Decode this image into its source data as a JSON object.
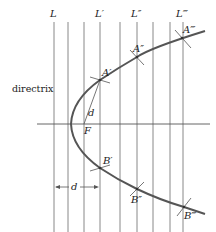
{
  "figure": {
    "colors": {
      "lines": "#7a7a7a",
      "curve": "#555555",
      "text": "#222222"
    },
    "vertical_lines": [
      {
        "x": 54,
        "label": "L"
      },
      {
        "x": 68,
        "label": ""
      },
      {
        "x": 84,
        "label": ""
      },
      {
        "x": 100,
        "label": "L′"
      },
      {
        "x": 120,
        "label": ""
      },
      {
        "x": 137,
        "label": "L″"
      },
      {
        "x": 153,
        "label": ""
      },
      {
        "x": 170,
        "label": ""
      },
      {
        "x": 183,
        "label": "L‴"
      }
    ],
    "labels": {
      "L": "L",
      "L1": "L′",
      "L2": "L″",
      "L3": "L‴",
      "directrix": "directrix",
      "focus": "F",
      "d_segment": "d",
      "d_arrow": "d",
      "A1": "A′",
      "A2": "A″",
      "A3": "A‴",
      "B1": "B′",
      "B2": "B″",
      "B3": "B‴"
    },
    "points": {
      "vertex": [
        71,
        124
      ],
      "focus": [
        84,
        124
      ],
      "A1": [
        100,
        80
      ],
      "A2": [
        137,
        57
      ],
      "A3": [
        182,
        38
      ],
      "B1": [
        100,
        168
      ],
      "B2": [
        137,
        189
      ],
      "B3": [
        184,
        207
      ]
    }
  }
}
